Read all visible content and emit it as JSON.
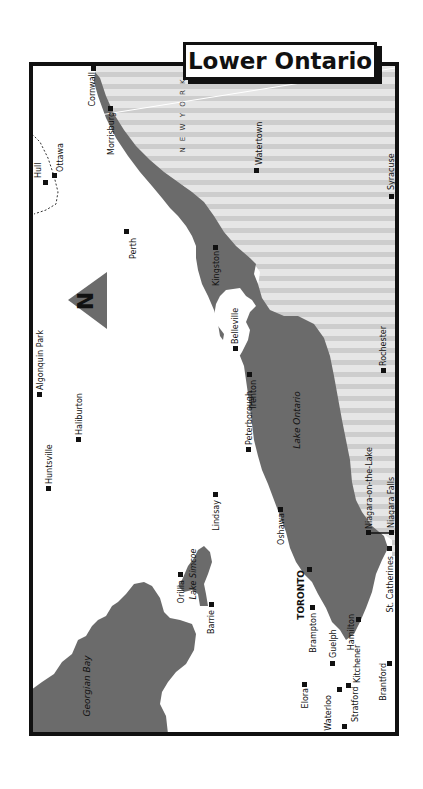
{
  "title": "Lower Ontario",
  "colors": {
    "water": "#6b6b6b",
    "usa_stripe_light": "#e4e4e4",
    "usa_stripe_dark": "#cfcfcf",
    "land": "#ffffff",
    "border": "#111111",
    "city_marker": "#111111"
  },
  "compass": {
    "label": "N",
    "icon": "north-arrow-icon"
  },
  "water_bodies": {
    "lake_ontario": "Lake Ontario",
    "lake_simcoe": "Lake Simcoe",
    "georgian_bay": "Georgian Bay"
  },
  "regions": {
    "new_york": "N E W  Y O R K"
  },
  "cities": {
    "cornwall": "Cornwall",
    "morrisburg": "Morrisburg",
    "hull": "Hull",
    "ottawa": "Ottawa",
    "perth": "Perth",
    "watertown": "Watertown",
    "syracuse": "Syracuse",
    "kingston": "Kingston",
    "algonquin_park": "Algonquin Park",
    "haliburton": "Haliburton",
    "huntsville": "Huntsville",
    "belleville": "Belleville",
    "trenton": "Trenton",
    "peterborough": "Peterborough",
    "rochester": "Rochester",
    "lindsay": "Lindsay",
    "oshawa": "Oshawa",
    "niagara_on_the_lake": "Niagara-on-the-Lake",
    "niagara_falls": "Niagara Falls",
    "orillia": "Orillia",
    "barrie": "Barrie",
    "toronto": "TORONTO",
    "st_catherines": "St. Catherines",
    "brampton": "Brampton",
    "hamilton": "Hamilton",
    "guelph": "Guelph",
    "elora": "Elora",
    "kitchener": "Kitchener",
    "waterloo": "Waterloo",
    "brantford": "Brantford",
    "stratford": "Stratford"
  }
}
